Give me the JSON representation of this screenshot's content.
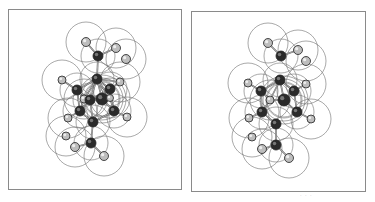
{
  "figure": {
    "type": "stereo-pair",
    "colors": {
      "border": "#8a8a8a",
      "surface_line": "#6e6e6e",
      "bond": "#555555",
      "dark_atom": "#2a2a2a",
      "light_atom": "#bdbdbd",
      "atom_outline": "#222222"
    },
    "panels": [
      {
        "id": "left",
        "offset_x": 0,
        "atoms": [
          {
            "x": 86,
            "y": 42,
            "r": 4.5,
            "kind": "light"
          },
          {
            "x": 98,
            "y": 56,
            "r": 5,
            "kind": "dark"
          },
          {
            "x": 116,
            "y": 48,
            "r": 4.5,
            "kind": "light"
          },
          {
            "x": 126,
            "y": 59,
            "r": 4.5,
            "kind": "light"
          },
          {
            "x": 97,
            "y": 79,
            "r": 5,
            "kind": "dark"
          },
          {
            "x": 62,
            "y": 80,
            "r": 4,
            "kind": "light"
          },
          {
            "x": 120,
            "y": 82,
            "r": 4,
            "kind": "light"
          },
          {
            "x": 77,
            "y": 90,
            "r": 5,
            "kind": "dark"
          },
          {
            "x": 110,
            "y": 89,
            "r": 5,
            "kind": "dark"
          },
          {
            "x": 84,
            "y": 99,
            "r": 4,
            "kind": "light"
          },
          {
            "x": 90,
            "y": 100,
            "r": 5,
            "kind": "dark"
          },
          {
            "x": 102,
            "y": 99,
            "r": 6,
            "kind": "dark"
          },
          {
            "x": 110,
            "y": 98,
            "r": 3.5,
            "kind": "light"
          },
          {
            "x": 80,
            "y": 111,
            "r": 5,
            "kind": "dark"
          },
          {
            "x": 114,
            "y": 111,
            "r": 5,
            "kind": "dark"
          },
          {
            "x": 68,
            "y": 118,
            "r": 4,
            "kind": "light"
          },
          {
            "x": 127,
            "y": 117,
            "r": 4,
            "kind": "light"
          },
          {
            "x": 93,
            "y": 122,
            "r": 5,
            "kind": "dark"
          },
          {
            "x": 66,
            "y": 136,
            "r": 4,
            "kind": "light"
          },
          {
            "x": 75,
            "y": 147,
            "r": 4.5,
            "kind": "light"
          },
          {
            "x": 91,
            "y": 143,
            "r": 5,
            "kind": "dark"
          },
          {
            "x": 104,
            "y": 156,
            "r": 4.5,
            "kind": "light"
          }
        ]
      },
      {
        "id": "right",
        "offset_x": 183,
        "atoms": [
          {
            "x": 268,
            "y": 43,
            "r": 4.5,
            "kind": "light"
          },
          {
            "x": 281,
            "y": 56,
            "r": 5,
            "kind": "dark"
          },
          {
            "x": 298,
            "y": 50,
            "r": 4.5,
            "kind": "light"
          },
          {
            "x": 306,
            "y": 61,
            "r": 4.5,
            "kind": "light"
          },
          {
            "x": 280,
            "y": 80,
            "r": 5,
            "kind": "dark"
          },
          {
            "x": 248,
            "y": 83,
            "r": 4,
            "kind": "light"
          },
          {
            "x": 306,
            "y": 84,
            "r": 4,
            "kind": "light"
          },
          {
            "x": 261,
            "y": 91,
            "r": 5,
            "kind": "dark"
          },
          {
            "x": 294,
            "y": 91,
            "r": 5,
            "kind": "dark"
          },
          {
            "x": 270,
            "y": 100,
            "r": 4,
            "kind": "light"
          },
          {
            "x": 284,
            "y": 100,
            "r": 6,
            "kind": "dark"
          },
          {
            "x": 262,
            "y": 112,
            "r": 5,
            "kind": "dark"
          },
          {
            "x": 297,
            "y": 112,
            "r": 5,
            "kind": "dark"
          },
          {
            "x": 249,
            "y": 118,
            "r": 4,
            "kind": "light"
          },
          {
            "x": 311,
            "y": 119,
            "r": 4,
            "kind": "light"
          },
          {
            "x": 276,
            "y": 124,
            "r": 5,
            "kind": "dark"
          },
          {
            "x": 252,
            "y": 137,
            "r": 4,
            "kind": "light"
          },
          {
            "x": 262,
            "y": 149,
            "r": 4.5,
            "kind": "light"
          },
          {
            "x": 276,
            "y": 145,
            "r": 5,
            "kind": "dark"
          },
          {
            "x": 289,
            "y": 158,
            "r": 4.5,
            "kind": "light"
          }
        ]
      }
    ],
    "caption_mark": "· · ·"
  }
}
